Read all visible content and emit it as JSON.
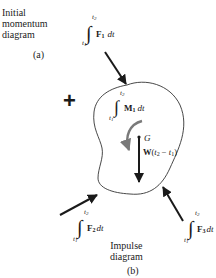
{
  "figure": {
    "initial_label": [
      "Initial",
      "momentum",
      "diagram"
    ],
    "initial_caption": "(a)",
    "plus_sign": "+",
    "impulse_label": [
      "Impulse",
      "diagram"
    ],
    "impulse_caption": "(b)"
  },
  "impulses": {
    "F1": {
      "upper": "t",
      "upper_sub": "2",
      "lower": "t",
      "lower_sub": "1",
      "vector": "F",
      "vector_sub": "1",
      "tail": "dt"
    },
    "F2": {
      "upper": "t",
      "upper_sub": "2",
      "lower": "t",
      "lower_sub": "1",
      "vector": "F",
      "vector_sub": "2",
      "tail": "dt"
    },
    "F3": {
      "upper": "t",
      "upper_sub": "2",
      "lower": "t",
      "lower_sub": "1",
      "vector": "F",
      "vector_sub": "3",
      "tail": "dt"
    },
    "M1": {
      "upper": "t",
      "upper_sub": "2",
      "lower": "t",
      "lower_sub": "1",
      "vector": "M",
      "vector_sub": "1",
      "tail": "dt"
    }
  },
  "weight_impulse": {
    "text_main": "W(",
    "t2": "t",
    "t2_sub": "2",
    "minus": " − ",
    "t1": "t",
    "t1_sub": "1",
    "close": ")"
  },
  "center_of_mass": "G",
  "colors": {
    "ink": "#1a1a1a",
    "moment_arrow": "#7a7a7a",
    "background": "#ffffff"
  }
}
